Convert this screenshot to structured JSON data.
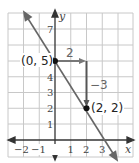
{
  "graph": {
    "x_axis_label": "x",
    "y_axis_label": "y",
    "x_ticks": [
      {
        "value": -2,
        "label": "−2"
      },
      {
        "value": -1,
        "label": "−1"
      },
      {
        "value": 1,
        "label": "1"
      },
      {
        "value": 2,
        "label": "2"
      },
      {
        "value": 3,
        "label": "3"
      }
    ],
    "y_ticks": [
      {
        "value": 1,
        "label": "1"
      },
      {
        "value": 2,
        "label": "2"
      },
      {
        "value": 3,
        "label": "3"
      },
      {
        "value": 4,
        "label": "4"
      },
      {
        "value": 7,
        "label": "7"
      }
    ],
    "line": {
      "slope": -1.5,
      "intercept": 5,
      "equation": "y = -3/2 x + 5"
    },
    "points": [
      {
        "x": 0,
        "y": 5,
        "label": "(0, 5)"
      },
      {
        "x": 2,
        "y": 2,
        "label": "(2, 2)"
      }
    ],
    "run": {
      "label": "2"
    },
    "rise": {
      "label": "−3"
    },
    "colors": {
      "grid": "#c8c8c8",
      "axis": "#333333",
      "line": "#666666",
      "step_arrows": "#666666",
      "point": "#111111"
    }
  }
}
